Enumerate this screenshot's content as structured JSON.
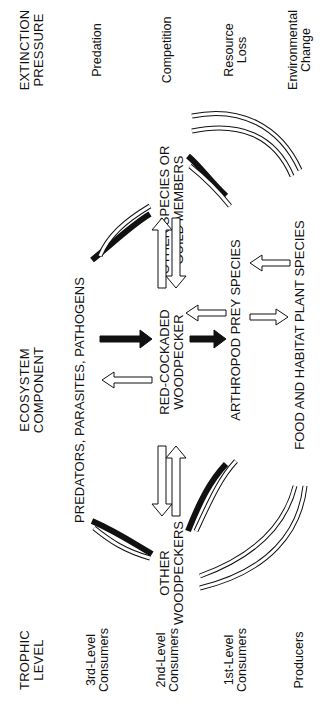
{
  "headers": {
    "trophic_level": "TROPHIC\nLEVEL",
    "ecosystem_component": "ECOSYSTEM\nCOMPONENT",
    "extinction_pressure": "EXTINCTION\nPRESSURE"
  },
  "trophic_levels": [
    {
      "label": "3rd-Level\nConsumers"
    },
    {
      "label": "2nd-Level\nConsumers"
    },
    {
      "label": "1st-Level\nConsumers"
    },
    {
      "label": "Producers"
    }
  ],
  "components": {
    "predators": "PREDATORS, PARASITES, PATHOGENS",
    "other_woodpeckers": "OTHER\nWOODPECKERS",
    "rcw": "RED-COCKADED\nWOODPECKER",
    "other_species": "OTHER SPECIES OR\nGUILD MEMBERS",
    "arthropods": "ARTHROPOD PREY SPECIES",
    "plants": "FOOD AND HABITAT PLANT SPECIES"
  },
  "pressures": [
    {
      "label": "Predation"
    },
    {
      "label": "Competition"
    },
    {
      "label": "Resource\nLoss"
    },
    {
      "label": "Environmental\nChange"
    }
  ],
  "legend_colors": {
    "strong_effect": "#111111",
    "weak_effect": "#ffffff"
  }
}
